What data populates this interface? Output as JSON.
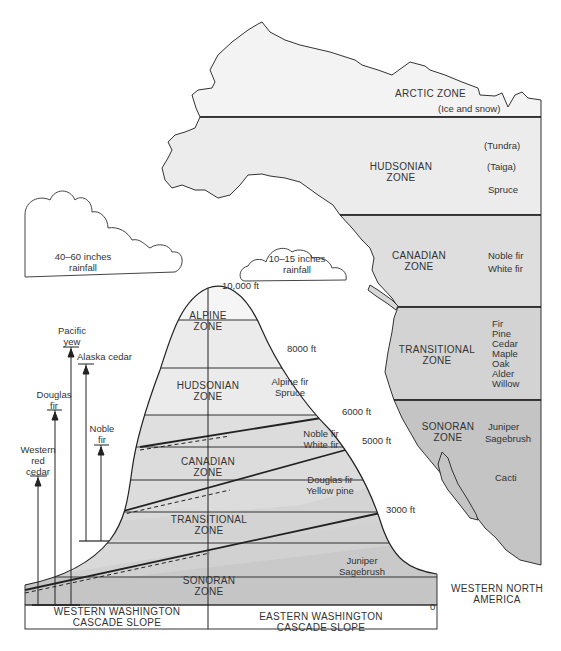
{
  "map": {
    "title": "WESTERN NORTH AMERICA",
    "zones": [
      {
        "name": "ARCTIC ZONE",
        "vegetation": [
          "(Ice and snow)"
        ],
        "color": "#f3f3f3"
      },
      {
        "name": "HUDSONIAN ZONE",
        "vegetation": [
          "(Tundra)",
          "(Taiga)",
          "Spruce"
        ],
        "color": "#ececec"
      },
      {
        "name": "CANADIAN ZONE",
        "vegetation": [
          "Noble fir",
          "White fir"
        ],
        "color": "#dedede"
      },
      {
        "name": "TRANSITIONAL ZONE",
        "vegetation": [
          "Fir",
          "Pine",
          "Cedar",
          "Maple",
          "Oak",
          "Alder",
          "Willow"
        ],
        "color": "#d3d3d3"
      },
      {
        "name": "SONORAN ZONE",
        "vegetation": [
          "Juniper",
          "Sagebrush",
          "Cacti"
        ],
        "color": "#c4c4c4"
      }
    ]
  },
  "clouds": {
    "west": {
      "line1": "40–60 inches",
      "line2": "rainfall"
    },
    "east": {
      "line1": "10–15 inches",
      "line2": "rainfall"
    }
  },
  "mountain": {
    "elevations": [
      "10,000 ft",
      "8000 ft",
      "6000 ft",
      "5000 ft",
      "3000 ft",
      "0"
    ],
    "zones": [
      {
        "line1": "ALPINE",
        "line2": "ZONE"
      },
      {
        "line1": "HUDSONIAN",
        "line2": "ZONE",
        "vegetation": [
          "Alpine fir",
          "Spruce"
        ]
      },
      {
        "line1": "CANADIAN",
        "line2": "ZONE",
        "vegetation": [
          "Noble fir",
          "White fir"
        ]
      },
      {
        "line1": "TRANSITIONAL",
        "line2": "ZONE",
        "vegetation": [
          "Douglas fir",
          "Yellow pine"
        ]
      },
      {
        "line1": "SONORAN",
        "line2": "ZONE",
        "vegetation": [
          "Juniper",
          "Sagebrush"
        ]
      }
    ],
    "slopes": {
      "west": {
        "line1": "WESTERN WASHINGTON",
        "line2": "CASCADE SLOPE"
      },
      "east": {
        "line1": "EASTERN WASHINGTON",
        "line2": "CASCADE SLOPE"
      }
    }
  },
  "tree_ranges": [
    {
      "line1": "Western",
      "line2": "red",
      "line3": "cedar"
    },
    {
      "line1": "Douglas",
      "line2": "fir"
    },
    {
      "line1": "Pacific",
      "line2": "yew"
    },
    {
      "line1": "Alaska cedar"
    },
    {
      "line1": "Noble",
      "line2": "fir"
    }
  ]
}
